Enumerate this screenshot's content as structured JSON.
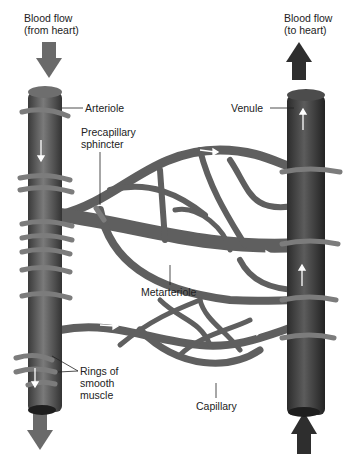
{
  "labels": {
    "flow_in": "Blood flow\n(from heart)",
    "flow_out": "Blood flow\n(to heart)",
    "arteriole": "Arteriole",
    "venule": "Venule",
    "precapillary_sphincter": "Precapillary\nsphincter",
    "metarteriole": "Metarteriole",
    "rings": "Rings of\nsmooth\nmuscle",
    "capillary": "Capillary"
  },
  "colors": {
    "vessel": "#5f5f5f",
    "vessel_dark": "#3a3a3a",
    "ring": "#7c7c7c",
    "arrow_in": "#6a6a6a",
    "arrow_out": "#2e2e2e",
    "flow_arrow": "#ffffff",
    "text": "#222222"
  }
}
